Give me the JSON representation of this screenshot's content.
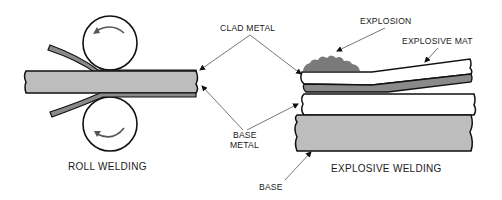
{
  "diagram": {
    "left": {
      "title": "ROLL WELDING"
    },
    "right": {
      "title": "EXPLOSIVE WELDING"
    },
    "labels": {
      "clad_metal": "CLAD METAL",
      "base_metal_line1": "BASE",
      "base_metal_line2": "METAL",
      "explosion": "EXPLOSION",
      "explosive_mat": "EXPLOSIVE MAT",
      "base": "BASE"
    },
    "colors": {
      "base_fill": "#bdbdbd",
      "clad_fill": "#8a8a8a",
      "explosion_fill": "#7a7a7a",
      "line": "#111111"
    }
  }
}
